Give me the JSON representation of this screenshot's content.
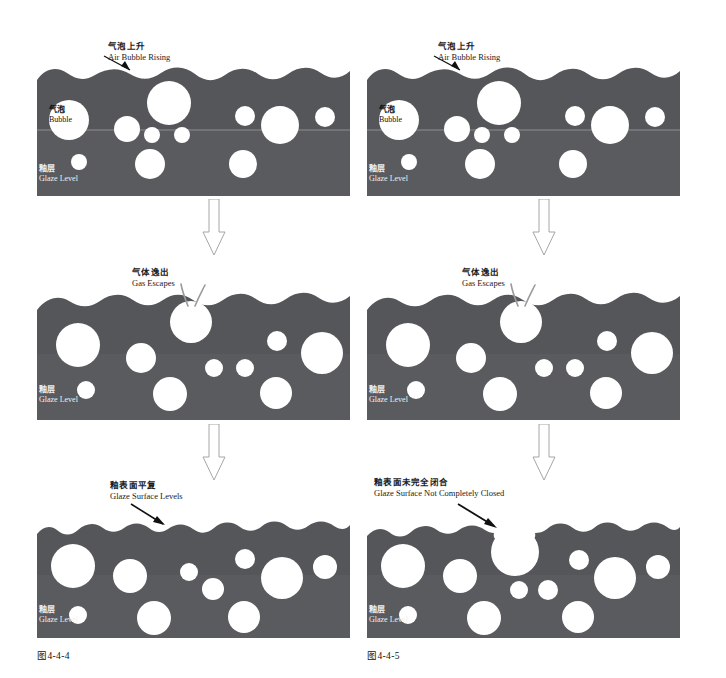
{
  "diagram": {
    "title_visible": false,
    "colors": {
      "glaze": "#55565a",
      "glaze_lower": "#5a5b5f",
      "bubble": "#ffffff",
      "background": "#ffffff",
      "text_dark": "#1a1a1a",
      "text_light": "#efefef",
      "arrow_outline": "#9a9a9a",
      "pointer": "#111111"
    },
    "columns": [
      {
        "id": "left",
        "caption": "图4-4-4",
        "panels": [
          {
            "id": "left-stage-1",
            "stage": 1,
            "callout": {
              "cn": "气泡上升",
              "en": "Air Bubble Rising"
            },
            "bubble_label": {
              "cn": "气泡",
              "en": "Bubble"
            },
            "glaze_label": {
              "cn": "釉层",
              "en": "Glaze Level"
            },
            "surface": "wavy",
            "has_level_line": true
          },
          {
            "id": "left-stage-2",
            "stage": 2,
            "callout": {
              "cn": "气体逸出",
              "en": "Gas Escapes"
            },
            "glaze_label": {
              "cn": "釉层",
              "en": "Glaze Level"
            },
            "surface": "wavy-burst",
            "has_level_line": false
          },
          {
            "id": "left-stage-3",
            "stage": 3,
            "callout": {
              "cn": "釉表面平复",
              "en": "Glaze Surface Levels"
            },
            "glaze_label": {
              "cn": "釉层",
              "en": "Glaze Level"
            },
            "surface": "wavy-smooth",
            "has_level_line": false
          }
        ]
      },
      {
        "id": "right",
        "caption": "图4-4-5",
        "panels": [
          {
            "id": "right-stage-1",
            "stage": 1,
            "callout": {
              "cn": "气泡上升",
              "en": "Air Bubble Rising"
            },
            "bubble_label": {
              "cn": "气泡",
              "en": "Bubble"
            },
            "glaze_label": {
              "cn": "釉层",
              "en": "Glaze Level"
            },
            "surface": "wavy",
            "has_level_line": true
          },
          {
            "id": "right-stage-2",
            "stage": 2,
            "callout": {
              "cn": "气体逸出",
              "en": "Gas Escapes"
            },
            "glaze_label": {
              "cn": "釉层",
              "en": "Glaze Level"
            },
            "surface": "wavy-burst",
            "has_level_line": false
          },
          {
            "id": "right-stage-3",
            "stage": 3,
            "callout": {
              "cn": "釉表面未完全闭合",
              "en": "Glaze Surface Not Completely Closed"
            },
            "glaze_label": {
              "cn": "釉层",
              "en": "Glaze Level"
            },
            "surface": "wavy-open-crater",
            "has_level_line": false
          }
        ]
      }
    ],
    "flow_arrows": [
      {
        "id": "left-arrow-1-2",
        "direction": "down"
      },
      {
        "id": "left-arrow-2-3",
        "direction": "down"
      },
      {
        "id": "right-arrow-1-2",
        "direction": "down"
      },
      {
        "id": "right-arrow-2-3",
        "direction": "down"
      }
    ]
  }
}
